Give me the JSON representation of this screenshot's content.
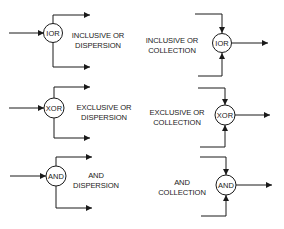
{
  "colors": {
    "stroke": "#1a1a1a",
    "background": "#ffffff"
  },
  "junctions": [
    {
      "id": "ior-dispersion",
      "gate": "IOR",
      "label_line1": "INCLUSIVE OR",
      "label_line2": "DISPERSION",
      "kind": "dispersion",
      "inputs": 1,
      "outputs": 2
    },
    {
      "id": "ior-collection",
      "gate": "IOR",
      "label_line1": "INCLUSIVE OR",
      "label_line2": "COLLECTION",
      "kind": "collection",
      "inputs": 2,
      "outputs": 1
    },
    {
      "id": "xor-dispersion",
      "gate": "XOR",
      "label_line1": "EXCLUSIVE OR",
      "label_line2": "DISPERSION",
      "kind": "dispersion",
      "inputs": 1,
      "outputs": 2
    },
    {
      "id": "xor-collection",
      "gate": "XOR",
      "label_line1": "EXCLUSIVE OR",
      "label_line2": "COLLECTION",
      "kind": "collection",
      "inputs": 2,
      "outputs": 1
    },
    {
      "id": "and-dispersion",
      "gate": "AND",
      "label_line1": "AND",
      "label_line2": "DISPERSION",
      "kind": "dispersion",
      "inputs": 1,
      "outputs": 2
    },
    {
      "id": "and-collection",
      "gate": "AND",
      "label_line1": "AND",
      "label_line2": "COLLECTION",
      "kind": "collection",
      "inputs": 2,
      "outputs": 1
    }
  ]
}
